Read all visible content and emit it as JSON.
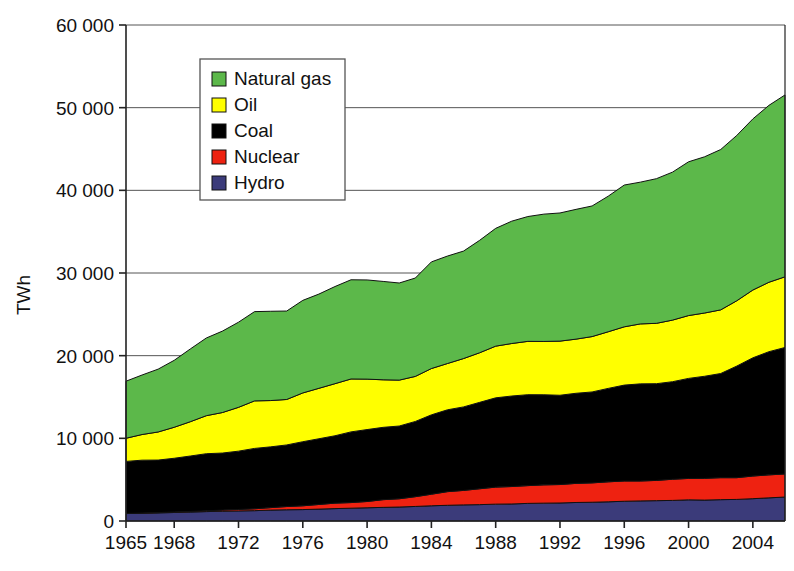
{
  "chart_data": {
    "type": "area",
    "stacked": true,
    "title": "",
    "xlabel": "",
    "ylabel": "TWh",
    "ylim": [
      0,
      60000
    ],
    "xlim": [
      1965,
      2006
    ],
    "grid": true,
    "legend_position": "top-left-inside",
    "ytick_labels": [
      "0",
      "10 000",
      "20 000",
      "30 000",
      "40 000",
      "50 000",
      "60 000"
    ],
    "ytick_values": [
      0,
      10000,
      20000,
      30000,
      40000,
      50000,
      60000
    ],
    "xtick_labels": [
      "1965",
      "1968",
      "1972",
      "1976",
      "1980",
      "1984",
      "1988",
      "1992",
      "1996",
      "2000",
      "2004"
    ],
    "xtick_values": [
      1965,
      1968,
      1972,
      1976,
      1980,
      1984,
      1988,
      1992,
      1996,
      2000,
      2004
    ],
    "x": [
      1965,
      1966,
      1967,
      1968,
      1969,
      1970,
      1971,
      1972,
      1973,
      1974,
      1975,
      1976,
      1977,
      1978,
      1979,
      1980,
      1981,
      1982,
      1983,
      1984,
      1985,
      1986,
      1987,
      1988,
      1989,
      1990,
      1991,
      1992,
      1993,
      1994,
      1995,
      1996,
      1997,
      1998,
      1999,
      2000,
      2001,
      2002,
      2003,
      2004,
      2005,
      2006
    ],
    "series": [
      {
        "name": "Hydro",
        "color": "#3B3B7A",
        "values": [
          900,
          940,
          980,
          1030,
          1080,
          1140,
          1180,
          1220,
          1250,
          1320,
          1360,
          1380,
          1440,
          1500,
          1550,
          1600,
          1650,
          1690,
          1760,
          1840,
          1900,
          1950,
          1980,
          2040,
          2060,
          2130,
          2160,
          2180,
          2240,
          2270,
          2320,
          2390,
          2430,
          2460,
          2490,
          2560,
          2530,
          2580,
          2610,
          2700,
          2800,
          2900
        ]
      },
      {
        "name": "Nuclear",
        "color": "#EE2211",
        "values": [
          10,
          20,
          40,
          60,
          80,
          100,
          140,
          180,
          230,
          300,
          390,
          460,
          560,
          660,
          680,
          760,
          930,
          1000,
          1180,
          1400,
          1650,
          1750,
          1920,
          2060,
          2110,
          2150,
          2210,
          2230,
          2310,
          2340,
          2420,
          2450,
          2410,
          2450,
          2560,
          2590,
          2630,
          2660,
          2630,
          2740,
          2780,
          2790
        ]
      },
      {
        "name": "Coal",
        "color": "#000000",
        "values": [
          6300,
          6400,
          6350,
          6500,
          6700,
          6900,
          6900,
          7050,
          7300,
          7350,
          7450,
          7750,
          7950,
          8150,
          8550,
          8700,
          8750,
          8800,
          9100,
          9600,
          9900,
          10100,
          10450,
          10800,
          10950,
          11000,
          10900,
          10800,
          10900,
          11000,
          11300,
          11600,
          11750,
          11700,
          11800,
          12100,
          12350,
          12600,
          13500,
          14300,
          14900,
          15300
        ]
      },
      {
        "name": "Oil",
        "color": "#FFFF00",
        "values": [
          2800,
          3100,
          3400,
          3750,
          4150,
          4600,
          4900,
          5300,
          5750,
          5600,
          5500,
          5900,
          6100,
          6300,
          6400,
          6100,
          5750,
          5550,
          5450,
          5600,
          5600,
          5850,
          6000,
          6250,
          6350,
          6450,
          6450,
          6550,
          6550,
          6700,
          6850,
          7050,
          7250,
          7300,
          7450,
          7600,
          7650,
          7700,
          7900,
          8200,
          8400,
          8550
        ]
      },
      {
        "name": "Natural gas",
        "color": "#5CB84A",
        "values": [
          6900,
          7200,
          7600,
          8100,
          8800,
          9400,
          9850,
          10300,
          10800,
          10800,
          10700,
          11200,
          11400,
          11750,
          12000,
          12000,
          11900,
          11750,
          11900,
          12900,
          13000,
          13000,
          13600,
          14250,
          14800,
          15100,
          15400,
          15500,
          15700,
          15800,
          16400,
          17150,
          17150,
          17500,
          17900,
          18600,
          18900,
          19400,
          20000,
          20700,
          21400,
          22000
        ]
      }
    ],
    "totals_note": "",
    "legend_items": [
      {
        "label": "Natural gas",
        "color": "#5CB84A"
      },
      {
        "label": "Oil",
        "color": "#FFFF00"
      },
      {
        "label": "Coal",
        "color": "#000000"
      },
      {
        "label": "Nuclear",
        "color": "#EE2211"
      },
      {
        "label": "Hydro",
        "color": "#3B3B7A"
      }
    ]
  }
}
